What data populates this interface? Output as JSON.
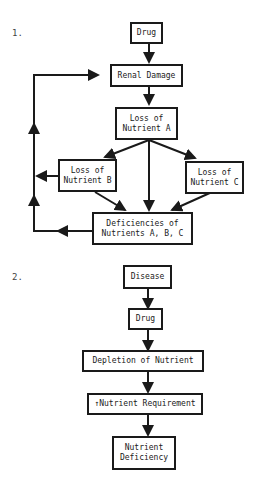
{
  "diagrams": [
    {
      "number": "1.",
      "nodes": {
        "drug": "Drug",
        "renal_damage": "Renal Damage",
        "loss_a": "Loss of\nNutrient A",
        "loss_b": "Loss of\nNutrient B",
        "loss_c": "Loss of\nNutrient C",
        "deficiencies": "Deficiencies of\nNutrients A, B, C"
      },
      "edges": [
        [
          "drug",
          "renal_damage"
        ],
        [
          "renal_damage",
          "loss_a"
        ],
        [
          "loss_a",
          "loss_b"
        ],
        [
          "loss_a",
          "loss_c"
        ],
        [
          "loss_a",
          "deficiencies"
        ],
        [
          "loss_b",
          "deficiencies"
        ],
        [
          "loss_c",
          "deficiencies"
        ],
        [
          "loss_b",
          "renal_damage"
        ],
        [
          "deficiencies",
          "renal_damage"
        ]
      ]
    },
    {
      "number": "2.",
      "nodes": {
        "disease": "Disease",
        "drug": "Drug",
        "depletion": "Depletion of Nutrient",
        "requirement": "↑Nutrient Requirement",
        "deficiency": "Nutrient\nDeficiency"
      },
      "edges": [
        [
          "disease",
          "drug"
        ],
        [
          "drug",
          "depletion"
        ],
        [
          "depletion",
          "requirement"
        ],
        [
          "requirement",
          "deficiency"
        ]
      ]
    }
  ]
}
